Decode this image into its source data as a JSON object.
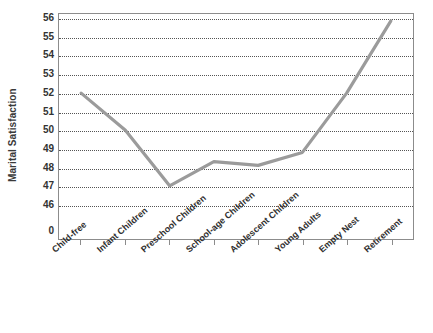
{
  "chart_data": {
    "type": "line",
    "title": "",
    "xlabel": "",
    "ylabel": "Marital Satisfaction",
    "categories": [
      "Child-free",
      "Infant Children",
      "Preschool Children",
      "School-age Children",
      "Adolescent Children",
      "Young Adults",
      "Empty Nest",
      "Retirement"
    ],
    "values": [
      52.0,
      50.0,
      47.0,
      48.3,
      48.1,
      48.8,
      52.0,
      55.9
    ],
    "series": [
      {
        "name": "Marital Satisfaction",
        "values": [
          52.0,
          50.0,
          47.0,
          48.3,
          48.1,
          48.8,
          52.0,
          55.9
        ]
      }
    ],
    "ylim": [
      46,
      56
    ],
    "ytick_labels": [
      "56",
      "55",
      "54",
      "53",
      "52",
      "51",
      "50",
      "49",
      "48",
      "47",
      "46",
      "0"
    ],
    "ytick_values": [
      56,
      55,
      54,
      53,
      52,
      51,
      50,
      49,
      48,
      47,
      46,
      0
    ],
    "grid": true,
    "grid_style": "dotted",
    "legend": false,
    "legend_position": "none",
    "line_color": "#999999",
    "axis_color": "#8c8c8c",
    "text_color": "#333333",
    "background_color": "#ffffff",
    "axis_break": true
  }
}
